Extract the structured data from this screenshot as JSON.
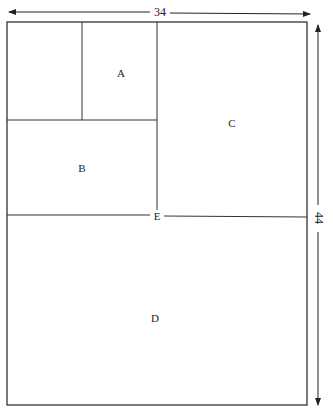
{
  "diagram": {
    "dimensions": {
      "width_label": "34",
      "height_label": "44"
    },
    "regions": [
      {
        "id": "blank",
        "label": ""
      },
      {
        "id": "A",
        "label": "A"
      },
      {
        "id": "B",
        "label": "B"
      },
      {
        "id": "C",
        "label": "C"
      },
      {
        "id": "D",
        "label": "D"
      }
    ],
    "line_label": "E",
    "colors": {
      "line": "#333333",
      "background": "#ffffff"
    }
  }
}
